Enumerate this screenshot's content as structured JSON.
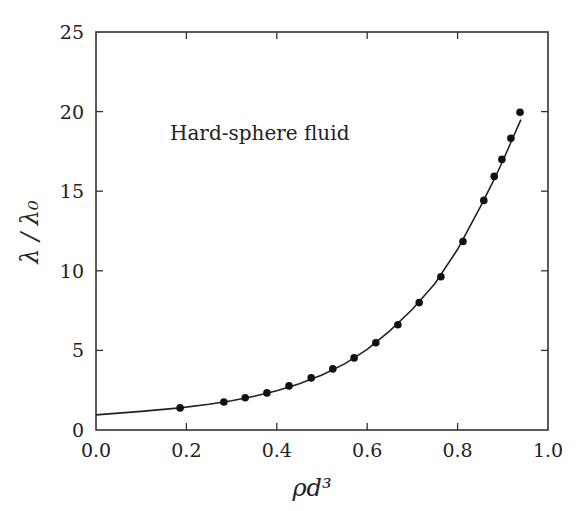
{
  "chart_data": {
    "type": "scatter",
    "title": "",
    "annotation": "Hard-sphere fluid",
    "xlabel": "ρd³",
    "ylabel": "λ / λ₀",
    "xlim": [
      0.0,
      1.0
    ],
    "ylim": [
      0,
      25
    ],
    "xticks": [
      0.0,
      0.2,
      0.4,
      0.6,
      0.8,
      1.0
    ],
    "xtick_labels": [
      "0.0",
      "0.2",
      "0.4",
      "0.6",
      "0.8",
      "1.0"
    ],
    "yticks": [
      0,
      5,
      10,
      15,
      20,
      25
    ],
    "ytick_labels": [
      "0",
      "5",
      "10",
      "15",
      "20",
      "25"
    ],
    "grid": false,
    "legend": null,
    "series": [
      {
        "name": "simulation data",
        "type": "scatter",
        "marker": "filled-circle",
        "color": "#111111",
        "x": [
          0.186,
          0.283,
          0.33,
          0.378,
          0.427,
          0.476,
          0.524,
          0.571,
          0.619,
          0.668,
          0.715,
          0.763,
          0.812,
          0.858,
          0.881,
          0.898,
          0.918,
          0.938
        ],
        "y": [
          1.39,
          1.76,
          2.02,
          2.33,
          2.77,
          3.27,
          3.84,
          4.53,
          5.48,
          6.61,
          8.0,
          9.63,
          11.84,
          14.42,
          15.93,
          17.0,
          18.32,
          19.96
        ]
      },
      {
        "name": "theory curve",
        "type": "line",
        "color": "#222222",
        "x": [
          0.0,
          0.1,
          0.186,
          0.25,
          0.3,
          0.35,
          0.4,
          0.45,
          0.5,
          0.55,
          0.6,
          0.65,
          0.7,
          0.75,
          0.8,
          0.85,
          0.88,
          0.9,
          0.92,
          0.94
        ],
        "y": [
          0.95,
          1.17,
          1.39,
          1.62,
          1.84,
          2.12,
          2.46,
          2.9,
          3.46,
          4.15,
          5.07,
          6.23,
          7.58,
          9.2,
          11.35,
          14.0,
          15.7,
          16.9,
          18.2,
          19.5
        ]
      }
    ]
  }
}
